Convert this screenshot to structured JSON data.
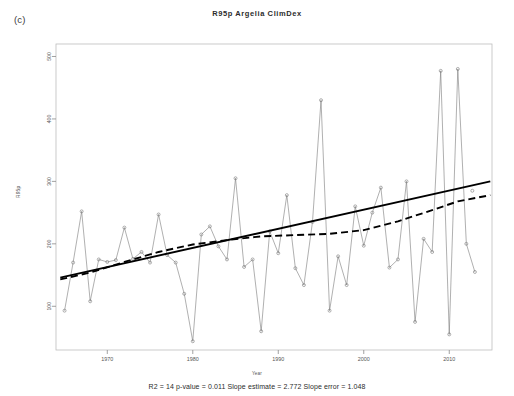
{
  "panel": {
    "label": "(c)"
  },
  "chart_data": {
    "type": "line",
    "title": "R95p  Argelia  ClimDex",
    "xlabel": "Year",
    "ylabel": "R95p",
    "grid": false,
    "legend": "none",
    "xlim": [
      1964,
      2015
    ],
    "ylim": [
      30,
      520
    ],
    "xticks": [
      1970,
      1980,
      1990,
      2000,
      2010
    ],
    "yticks": [
      100,
      200,
      300,
      400,
      500
    ],
    "x": [
      1965,
      1966,
      1967,
      1968,
      1969,
      1970,
      1971,
      1972,
      1973,
      1974,
      1975,
      1976,
      1977,
      1978,
      1979,
      1980,
      1981,
      1982,
      1983,
      1984,
      1985,
      1986,
      1987,
      1988,
      1989,
      1990,
      1991,
      1992,
      1993,
      1994,
      1995,
      1996,
      1997,
      1998,
      1999,
      2000,
      2001,
      2002,
      2003,
      2004,
      2005,
      2006,
      2007,
      2008,
      2009,
      2010,
      2011,
      2012,
      2013,
      2014
    ],
    "series": [
      {
        "name": "R95p annual value",
        "style": "thin-line-with-open-circles",
        "color": "#7a7a7a",
        "values": [
          93,
          170,
          252,
          108,
          175,
          171,
          174,
          226,
          176,
          187,
          170,
          247,
          182,
          170,
          120,
          44,
          215,
          228,
          196,
          175,
          305,
          163,
          175,
          60,
          220,
          185,
          278,
          161,
          134,
          235,
          430,
          93,
          180,
          134,
          260,
          197,
          250,
          290,
          162,
          175,
          300,
          75,
          208,
          187,
          477,
          55,
          480,
          200,
          155,
          null
        ]
      },
      {
        "name": "linear trend",
        "style": "thick-solid",
        "color": "#000000",
        "x": [
          1964.5,
          2014.8
        ],
        "values": [
          146,
          300
        ]
      },
      {
        "name": "smoothed trend",
        "style": "thick-dashed",
        "color": "#000000",
        "x": [
          1964.5,
          1968,
          1972,
          1976,
          1980,
          1984,
          1988,
          1992,
          1996,
          2000,
          2004,
          2008,
          2011,
          2014.8
        ],
        "values": [
          143,
          154,
          171,
          187,
          199,
          206,
          212,
          214,
          216,
          222,
          236,
          254,
          268,
          278
        ]
      }
    ],
    "isolated_points": [
      {
        "x": 2012.7,
        "y": 285,
        "note": "outlier marker right of series"
      }
    ],
    "stats_caption": "R2 = 14  p-value = 0.011  Slope estimate = 2.772  Slope error = 1.048",
    "stats": {
      "r2_label": "R2",
      "r2": "14",
      "p_value_label": "p-value",
      "p_value": "0.011",
      "slope_estimate_label": "Slope estimate",
      "slope_estimate": "2.772",
      "slope_error_label": "Slope error",
      "slope_error": "1.048"
    }
  }
}
